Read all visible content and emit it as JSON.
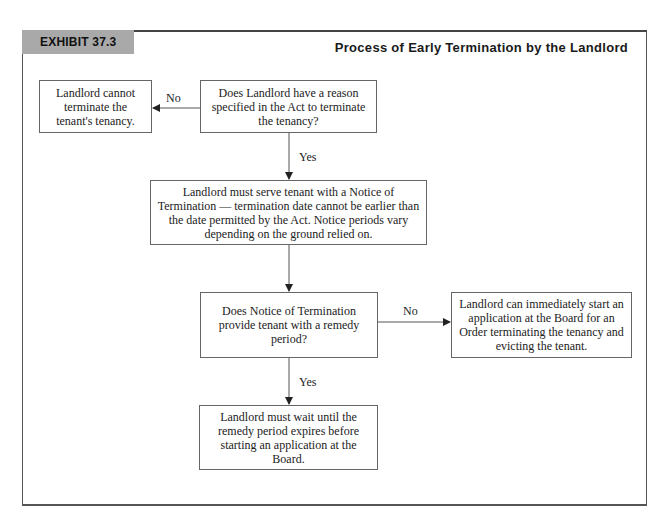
{
  "exhibit": {
    "tag": "EXHIBIT 37.3",
    "title": "Process of Early Termination by the Landlord"
  },
  "flowchart": {
    "nodes": [
      {
        "id": "cannot-terminate",
        "text": "Landlord cannot terminate the tenant's tenancy."
      },
      {
        "id": "reason-question",
        "text": "Does Landlord have a reason specified in the Act to terminate the tenancy?"
      },
      {
        "id": "serve-notice",
        "text": "Landlord must serve tenant with a Notice of Termination — termination date cannot be earlier than the date permitted by the Act. Notice periods vary depending on the ground relied on."
      },
      {
        "id": "remedy-question",
        "text": "Does Notice of Termination provide tenant with a remedy period?"
      },
      {
        "id": "start-application",
        "text": "Landlord can immediately start an application at the Board for an Order terminating the tenancy and evicting the tenant."
      },
      {
        "id": "wait-remedy",
        "text": "Landlord must wait until the remedy period expires before starting an application at the Board."
      }
    ],
    "edge_labels": {
      "reason_no": "No",
      "reason_yes": "Yes",
      "remedy_no": "No",
      "remedy_yes": "Yes"
    },
    "edges": [
      {
        "from": "reason-question",
        "to": "cannot-terminate",
        "label": "No"
      },
      {
        "from": "reason-question",
        "to": "serve-notice",
        "label": "Yes"
      },
      {
        "from": "serve-notice",
        "to": "remedy-question",
        "label": ""
      },
      {
        "from": "remedy-question",
        "to": "start-application",
        "label": "No"
      },
      {
        "from": "remedy-question",
        "to": "wait-remedy",
        "label": "Yes"
      }
    ]
  },
  "colors": {
    "tag_background": "#a9a9a9",
    "border": "#666666",
    "text": "#222222"
  }
}
